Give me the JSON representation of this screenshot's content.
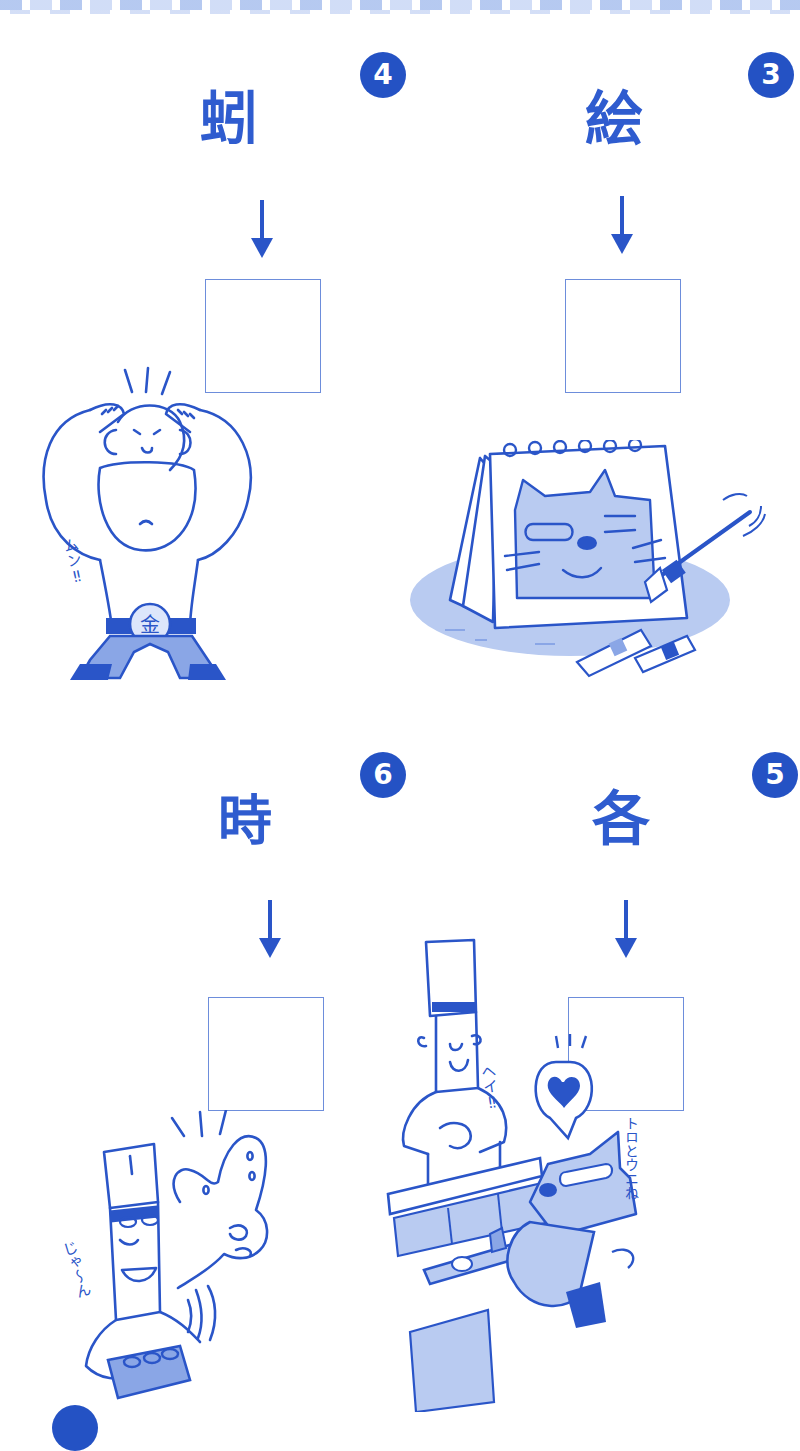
{
  "page": {
    "ink_color": "#2a55c8",
    "fill_light": "#b9cbf1",
    "fill_mid": "#8aa6e6",
    "badge_color": "#2452c4"
  },
  "puzzles": [
    {
      "number": "4",
      "scrambled_kanji": "蚓",
      "kanji_parts": [
        "虫",
        "弓"
      ],
      "arrow": "↓",
      "answer_box": "",
      "illustration": "muscular-wrestler-flexing",
      "sfx": "ムン‼",
      "belt_label": "金"
    },
    {
      "number": "3",
      "scrambled_kanji": "絵",
      "kanji_parts": [
        "会",
        "糸"
      ],
      "arrow": "↓",
      "answer_box": "",
      "illustration": "sketchbook-cat-painting",
      "sfx": ""
    },
    {
      "number": "6",
      "scrambled_kanji": "時",
      "kanji_parts": [
        "日",
        "匕",
        "寸"
      ],
      "arrow": "↓",
      "answer_box": "",
      "illustration": "sushi-chef-thumbs-up",
      "sfx": "じゃ〜ん"
    },
    {
      "number": "5",
      "scrambled_kanji": "各",
      "kanji_parts": [
        "夂",
        "口"
      ],
      "arrow": "↓",
      "answer_box": "",
      "illustration": "sushi-counter-cat",
      "sfx": "ヘイ‼",
      "sfx2": "トロとウニね"
    }
  ],
  "display": {
    "p4_kanji": "蚓",
    "p3_kanji": "絵",
    "p6_kanji": "時",
    "p5_kanji": "各",
    "p4_num": "4",
    "p3_num": "3",
    "p6_num": "6",
    "p5_num": "5",
    "p4_sfx": "ムン‼",
    "p4_belt": "金",
    "p6_sfx": "じゃ〜ん",
    "p5_sfx": "ヘイ‼",
    "p5_sfx2": "トロとウニね"
  }
}
